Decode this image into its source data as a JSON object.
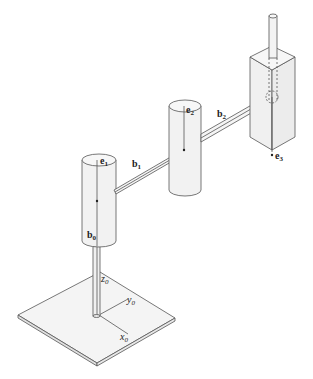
{
  "diagram": {
    "type": "robot-manipulator-schematic",
    "labels": {
      "e1": {
        "base": "e",
        "sub": "1"
      },
      "e2": {
        "base": "e",
        "sub": "2"
      },
      "e3": {
        "base": "e",
        "sub": "3"
      },
      "b0": {
        "base": "b",
        "sub": "0"
      },
      "b1": {
        "base": "b",
        "sub": "1"
      },
      "b2": {
        "base": "b",
        "sub": "2"
      },
      "x0": {
        "base": "x",
        "sub": "0"
      },
      "y0": {
        "base": "y",
        "sub": "0"
      },
      "z0": {
        "base": "z",
        "sub": "0"
      }
    },
    "colors": {
      "stroke": "#555555",
      "fill": "#f0f0f0",
      "background": "#ffffff"
    }
  }
}
